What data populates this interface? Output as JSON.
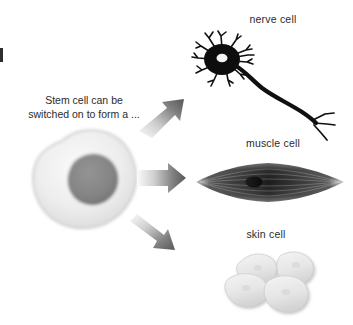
{
  "diagram": {
    "background_color": "#ffffff",
    "caption": {
      "line1": "Stem cell can be",
      "line2": "switched on to form a ..."
    },
    "source_cell": {
      "name": "stem cell",
      "body_color": "#ececec",
      "nucleus_color": "#858585"
    },
    "arrows": [
      {
        "name": "arrow-to-nerve-cell",
        "direction": "up-right",
        "gradient_from": "#f2f2f2",
        "gradient_to": "#5f5f5f"
      },
      {
        "name": "arrow-to-muscle-cell",
        "direction": "right",
        "gradient_from": "#f2f2f2",
        "gradient_to": "#5f5f5f"
      },
      {
        "name": "arrow-to-skin-cell",
        "direction": "down-right",
        "gradient_from": "#f2f2f2",
        "gradient_to": "#5f5f5f"
      }
    ],
    "targets": [
      {
        "key": "nerve",
        "label": "nerve cell",
        "label_x": 273,
        "label_y": 12,
        "color": "#111111"
      },
      {
        "key": "muscle",
        "label": "muscle cell",
        "label_x": 273,
        "label_y": 136,
        "color": "#3a3a3a"
      },
      {
        "key": "skin",
        "label": "skin cell",
        "label_x": 266,
        "label_y": 227,
        "color": "#e3e3e3"
      }
    ]
  }
}
